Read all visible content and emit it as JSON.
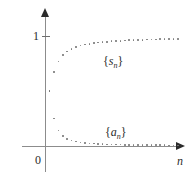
{
  "figure": {
    "title": "",
    "axes": {
      "y_tick_label": "1",
      "origin_label": "0",
      "x_axis_label": "n",
      "y_axis_name": "y-axis",
      "x_axis_name": "x-axis"
    },
    "labels": {
      "partial_sums_prefix": "{",
      "partial_sums_var": "s",
      "partial_sums_sub": "n",
      "partial_sums_suffix": "}",
      "terms_prefix": "{",
      "terms_var": "a",
      "terms_sub": "n",
      "terms_suffix": "}"
    },
    "colors": {
      "axis": "#8c8c8c",
      "arrow": "#2b2b2b",
      "dot": "#7a7a7a",
      "text": "#2b2b2b",
      "background": "#ffffff"
    }
  },
  "chart_data": {
    "type": "scatter",
    "title": "",
    "xlabel": "n",
    "ylabel": "",
    "xlim": [
      0,
      30
    ],
    "ylim": [
      0,
      1.15
    ],
    "grid": false,
    "legend": "inline-annotations",
    "y_ticks": [
      1
    ],
    "y_tick_labels": [
      "1"
    ],
    "x_ticks": [],
    "annotations": [
      {
        "text": "{s_n}",
        "x": 12.0,
        "y": 0.78
      },
      {
        "text": "{a_n}",
        "x": 12.2,
        "y": 0.17
      }
    ],
    "series": [
      {
        "name": "{s_n}",
        "description": "partial sums converging to 1",
        "x": [
          1,
          2,
          3,
          4,
          5,
          6,
          7,
          8,
          9,
          10,
          11,
          12,
          13,
          14,
          15,
          16,
          17,
          18,
          19,
          20,
          21,
          22,
          23,
          24,
          25,
          26,
          27,
          28,
          29,
          30
        ],
        "y": [
          0.5,
          0.675,
          0.77,
          0.825,
          0.86,
          0.883,
          0.9,
          0.912,
          0.921,
          0.929,
          0.935,
          0.94,
          0.945,
          0.948,
          0.952,
          0.955,
          0.957,
          0.959,
          0.961,
          0.963,
          0.965,
          0.966,
          0.968,
          0.969,
          0.97,
          0.971,
          0.972,
          0.973,
          0.974,
          0.975
        ]
      },
      {
        "name": "{a_n}",
        "description": "terms decaying to 0",
        "x": [
          1,
          2,
          3,
          4,
          5,
          6,
          7,
          8,
          9,
          10,
          11,
          12,
          13,
          14,
          15,
          16,
          17,
          18,
          19,
          20,
          21,
          22,
          23,
          24,
          25,
          26,
          27,
          28,
          29,
          30
        ],
        "y": [
          0.5,
          0.25,
          0.14,
          0.092,
          0.066,
          0.05,
          0.04,
          0.033,
          0.028,
          0.024,
          0.021,
          0.019,
          0.017,
          0.015,
          0.014,
          0.013,
          0.012,
          0.011,
          0.01,
          0.01,
          0.009,
          0.009,
          0.008,
          0.008,
          0.007,
          0.007,
          0.007,
          0.006,
          0.006,
          0.006
        ]
      }
    ]
  }
}
